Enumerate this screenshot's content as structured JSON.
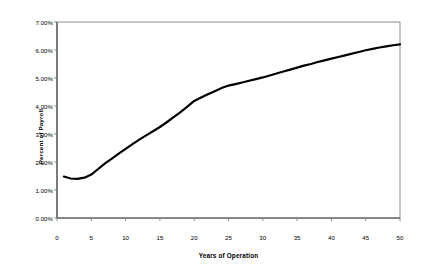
{
  "chart_data": {
    "type": "line",
    "title": "",
    "xlabel": "Years of Operation",
    "ylabel": "Percent of Payroll",
    "xlim": [
      0,
      50
    ],
    "ylim": [
      0,
      7
    ],
    "grid": false,
    "legend": "none",
    "x_ticks": [
      "0",
      "5",
      "10",
      "15",
      "20",
      "25",
      "30",
      "35",
      "40",
      "45",
      "50"
    ],
    "x_tick_values": [
      0,
      5,
      10,
      15,
      20,
      25,
      30,
      35,
      40,
      45,
      50
    ],
    "y_ticks": [
      "0.00%",
      "1.00%",
      "2.00%",
      "3.00%",
      "4.00%",
      "5.00%",
      "6.00%",
      "7.00%"
    ],
    "y_tick_values": [
      0,
      1,
      2,
      3,
      4,
      5,
      6,
      7
    ],
    "series": [
      {
        "name": "Percent of Payroll",
        "color": "#000000",
        "line_width": 2.2,
        "x": [
          1,
          2,
          3,
          4,
          5,
          6,
          7,
          8,
          9,
          10,
          11,
          12,
          13,
          14,
          15,
          16,
          17,
          18,
          19,
          20,
          21,
          22,
          23,
          24,
          25,
          26,
          27,
          28,
          29,
          30,
          31,
          32,
          33,
          34,
          35,
          36,
          37,
          38,
          39,
          40,
          41,
          42,
          43,
          44,
          45,
          46,
          47,
          48,
          49,
          50
        ],
        "values": [
          1.48,
          1.41,
          1.4,
          1.44,
          1.55,
          1.75,
          1.95,
          2.12,
          2.3,
          2.47,
          2.64,
          2.8,
          2.95,
          3.1,
          3.25,
          3.42,
          3.6,
          3.78,
          3.98,
          4.18,
          4.3,
          4.42,
          4.53,
          4.64,
          4.73,
          4.78,
          4.84,
          4.9,
          4.96,
          5.02,
          5.09,
          5.16,
          5.23,
          5.3,
          5.37,
          5.44,
          5.5,
          5.57,
          5.63,
          5.69,
          5.75,
          5.81,
          5.87,
          5.93,
          5.99,
          6.04,
          6.09,
          6.13,
          6.17,
          6.2
        ]
      }
    ],
    "axis_color": "#808080",
    "tick_color": "#808080",
    "plot_background": "#ffffff"
  }
}
